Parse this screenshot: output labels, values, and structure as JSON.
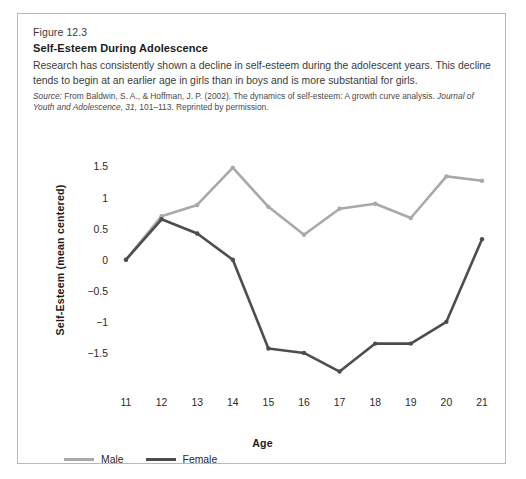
{
  "figure": {
    "number": "Figure 12.3",
    "title": "Self-Esteem During Adolescence",
    "description": "Research has consistently shown a decline in self-esteem during the adolescent years. This decline tends to begin at an earlier age in girls than in boys and is more substantial for girls.",
    "source_label": "Source:",
    "source_text_1": " From Baldwin, S. A., & Hoffman, J. P. (2002). The dynamics of self-esteem: A growth curve analysis. ",
    "source_journal": "Journal of Youth and Adolescence, 31,",
    "source_text_2": " 101–113. Reprinted by permission."
  },
  "colors": {
    "male_line": "#a9a9a9",
    "female_line": "#4d4d4d",
    "card_border": "#b9b9b9",
    "text": "#2a2a2a",
    "background": "#ffffff"
  },
  "chart_data": {
    "type": "line",
    "title": "Self-Esteem During Adolescence",
    "xlabel": "Age",
    "ylabel": "Self-Esteem (mean centered)",
    "x": [
      11,
      12,
      13,
      14,
      15,
      16,
      17,
      18,
      19,
      20,
      21
    ],
    "xtick_labels": [
      "11",
      "12",
      "13",
      "14",
      "15",
      "16",
      "17",
      "18",
      "19",
      "20",
      "21"
    ],
    "ytick_labels": [
      "1.5",
      "1",
      "0.5",
      "0",
      "−0.5",
      "−1",
      "−1.5"
    ],
    "yticks": [
      1.5,
      1,
      0.5,
      0,
      -0.5,
      -1,
      -1.5
    ],
    "ylim": [
      -2.0,
      1.7
    ],
    "xlim": [
      11,
      21
    ],
    "grid": false,
    "legend_position": "bottom-left",
    "series": [
      {
        "name": "Male",
        "color": "#a9a9a9",
        "values": [
          0.0,
          0.7,
          0.88,
          1.48,
          0.85,
          0.4,
          0.82,
          0.9,
          0.67,
          1.34,
          1.27
        ]
      },
      {
        "name": "Female",
        "color": "#4d4d4d",
        "values": [
          0.0,
          0.65,
          0.42,
          0.0,
          -1.43,
          -1.5,
          -1.8,
          -1.35,
          -1.35,
          -1.0,
          0.33
        ]
      }
    ]
  },
  "legend": {
    "items": [
      {
        "label": "Male",
        "color": "#a9a9a9"
      },
      {
        "label": "Female",
        "color": "#4d4d4d"
      }
    ]
  }
}
